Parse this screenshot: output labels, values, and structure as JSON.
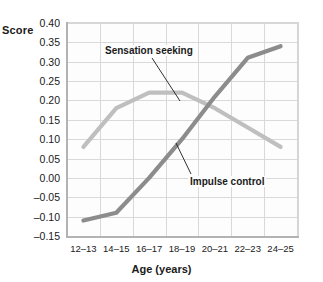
{
  "chart_data": {
    "type": "line",
    "title": "",
    "xlabel": "Age (years)",
    "ylabel": "Score",
    "categories": [
      "12–13",
      "14–15",
      "16–17",
      "18–19",
      "20–21",
      "22–23",
      "24–25"
    ],
    "ylim": [
      -0.15,
      0.4
    ],
    "yticks": [
      "0.40",
      "0.35",
      "0.30",
      "0.25",
      "0.20",
      "0.15",
      "0.10",
      "0.05",
      "0.00",
      "–0.05",
      "–0.10",
      "–0.15"
    ],
    "ytick_values": [
      0.4,
      0.35,
      0.3,
      0.25,
      0.2,
      0.15,
      0.1,
      0.05,
      0.0,
      -0.05,
      -0.1,
      -0.15
    ],
    "grid": true,
    "legend_position": "inline-annotations",
    "series": [
      {
        "name": "Sensation seeking",
        "color": "#bfbfbf",
        "values": [
          0.08,
          0.18,
          0.22,
          0.22,
          0.18,
          0.13,
          0.08
        ]
      },
      {
        "name": "Impulse control",
        "color": "#8c8c8c",
        "values": [
          -0.11,
          -0.09,
          0.0,
          0.1,
          0.21,
          0.31,
          0.34
        ]
      }
    ],
    "annotations": [
      {
        "text": "Sensation seeking",
        "target_series": "Sensation seeking"
      },
      {
        "text": "Impulse control",
        "target_series": "Impulse control"
      }
    ]
  },
  "axes": {
    "y_title": "Score",
    "x_title": "Age (years)"
  },
  "colors": {
    "sensation_seeking": "#bfbfbf",
    "impulse_control": "#8c8c8c",
    "grid": "#d9d9d9",
    "axis": "#b3b3b3",
    "text": "#1a1a1a",
    "plot_background": "#fdfdfd",
    "page_background": "#ffffff"
  }
}
